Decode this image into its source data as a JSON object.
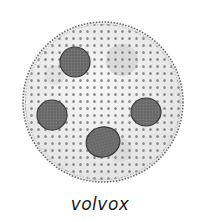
{
  "figure": {
    "label": "volvox",
    "colony": {
      "cx": 103,
      "cy": 102,
      "r": 80,
      "fill": "#efefef",
      "rim": "#6a6a6a"
    },
    "daughter_colonies": [
      {
        "cx": 75,
        "cy": 62,
        "rx": 15,
        "ry": 15
      },
      {
        "cx": 52,
        "cy": 115,
        "rx": 15,
        "ry": 15
      },
      {
        "cx": 146,
        "cy": 112,
        "rx": 15,
        "ry": 14
      },
      {
        "cx": 103,
        "cy": 142,
        "rx": 17,
        "ry": 15
      }
    ],
    "shadow_patches": [
      {
        "cx": 122,
        "cy": 60,
        "r": 16
      },
      {
        "cx": 120,
        "cy": 150,
        "r": 12
      },
      {
        "cx": 55,
        "cy": 75,
        "r": 10
      }
    ],
    "colors": {
      "daughter": "#6b6b6b",
      "daughter_edge": "#3a3a3a",
      "cell": "#8a8a8a"
    }
  }
}
